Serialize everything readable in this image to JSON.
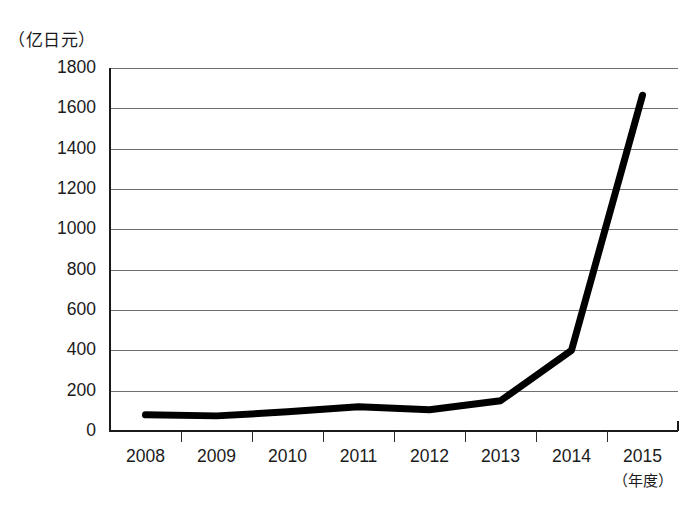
{
  "chart_data": {
    "type": "line",
    "title": "",
    "subtitle": "",
    "unit_label": "（亿日元）",
    "xlabel": "（年度）",
    "ylabel": "",
    "categories": [
      "2008",
      "2009",
      "2010",
      "2011",
      "2012",
      "2013",
      "2014",
      "2015"
    ],
    "values": [
      80,
      75,
      95,
      120,
      105,
      150,
      400,
      1665
    ],
    "series": [
      {
        "name": "金额",
        "values": [
          80,
          75,
          95,
          120,
          105,
          150,
          400,
          1665
        ],
        "color": "#000000"
      }
    ],
    "ylim": [
      0,
      1800
    ],
    "yticks": [
      0,
      200,
      400,
      600,
      800,
      1000,
      1200,
      1400,
      1600,
      1800
    ],
    "ytick_labels": [
      "0",
      "200",
      "400",
      "600",
      "800",
      "1000",
      "1200",
      "1400",
      "1600",
      "1800"
    ],
    "xlim": [
      "2008",
      "2015"
    ],
    "grid": true,
    "grid_axis": "y",
    "legend": false,
    "legend_position": "none",
    "line_width": 7,
    "annotations": []
  },
  "axes": {
    "y_unit_caption": "（亿日元）",
    "x_unit_caption": "（年度）",
    "axis_color": "#1a1a1a",
    "grid_color": "#6f6f6f",
    "background": "#ffffff"
  }
}
